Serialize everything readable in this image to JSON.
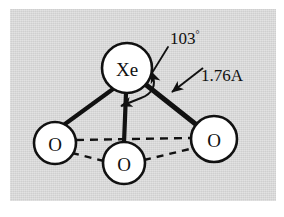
{
  "figure": {
    "kind": "molecular-structure-diagram",
    "molecule": "XeO3",
    "panel_background_color": "#cfcfcf",
    "page_background_color": "#ffffff",
    "ink_color": "#111111",
    "atom_fill_color": "#ffffff"
  },
  "atoms": [
    {
      "id": "xe-center",
      "label": "Xe",
      "role": "central-atom",
      "cx": 127,
      "cy": 68,
      "r": 25,
      "font_size": 19
    },
    {
      "id": "o-left",
      "label": "O",
      "role": "ligand-atom",
      "cx": 55,
      "cy": 143,
      "r": 21,
      "font_size": 19
    },
    {
      "id": "o-bottom",
      "label": "O",
      "role": "ligand-atom",
      "cx": 124,
      "cy": 163,
      "r": 21,
      "font_size": 19
    },
    {
      "id": "o-right",
      "label": "O",
      "role": "ligand-atom",
      "cx": 214,
      "cy": 139,
      "r": 23,
      "font_size": 19
    }
  ],
  "bonds": [
    {
      "id": "bond-xe-o-left",
      "from": "xe-center",
      "to": "o-left",
      "style": "solid",
      "width": 4
    },
    {
      "id": "bond-xe-o-bottom",
      "from": "xe-center",
      "to": "o-bottom",
      "style": "solid",
      "width": 4
    },
    {
      "id": "bond-xe-o-right",
      "from": "xe-center",
      "to": "o-right",
      "style": "solid",
      "width": 5
    }
  ],
  "guide_lines": [
    {
      "id": "guide-o-left-o-right",
      "from": "o-left",
      "to": "o-right",
      "style": "dashed",
      "width": 2.4
    },
    {
      "id": "guide-o-left-o-bottom",
      "from": "o-left",
      "to": "o-bottom",
      "style": "dashed",
      "width": 2.4
    },
    {
      "id": "guide-o-bottom-o-right",
      "from": "o-bottom",
      "to": "o-right",
      "style": "dashed",
      "width": 2.4
    }
  ],
  "annotations": {
    "bond_angle": {
      "id": "bond-angle-annotation",
      "text": "103",
      "unit_symbol": "°",
      "full_text": "103°",
      "measures": "O-Xe-O bond angle",
      "label_x": 170,
      "label_y": 44,
      "font_size": 17,
      "degree_font_size": 10
    },
    "bond_length": {
      "id": "bond-length-annotation",
      "text": "1.76A",
      "measures": "Xe-O bond length",
      "label_x": 201,
      "label_y": 81,
      "font_size": 17
    }
  }
}
